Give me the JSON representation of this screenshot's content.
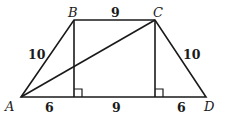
{
  "diagram": {
    "type": "isosceles-trapezoid",
    "vertices": {
      "A": {
        "label": "A",
        "x": 21,
        "y": 97
      },
      "B": {
        "label": "B",
        "x": 74,
        "y": 20
      },
      "C": {
        "label": "C",
        "x": 155,
        "y": 20
      },
      "D": {
        "label": "D",
        "x": 206,
        "y": 97
      }
    },
    "segments": {
      "AB": "10",
      "BC": "9",
      "CD": "10",
      "base_left": "6",
      "base_middle": "9",
      "base_right": "6"
    },
    "extra_lines": [
      "AC diagonal",
      "altitude from B",
      "altitude from C"
    ],
    "right_angle_markers": 2
  }
}
